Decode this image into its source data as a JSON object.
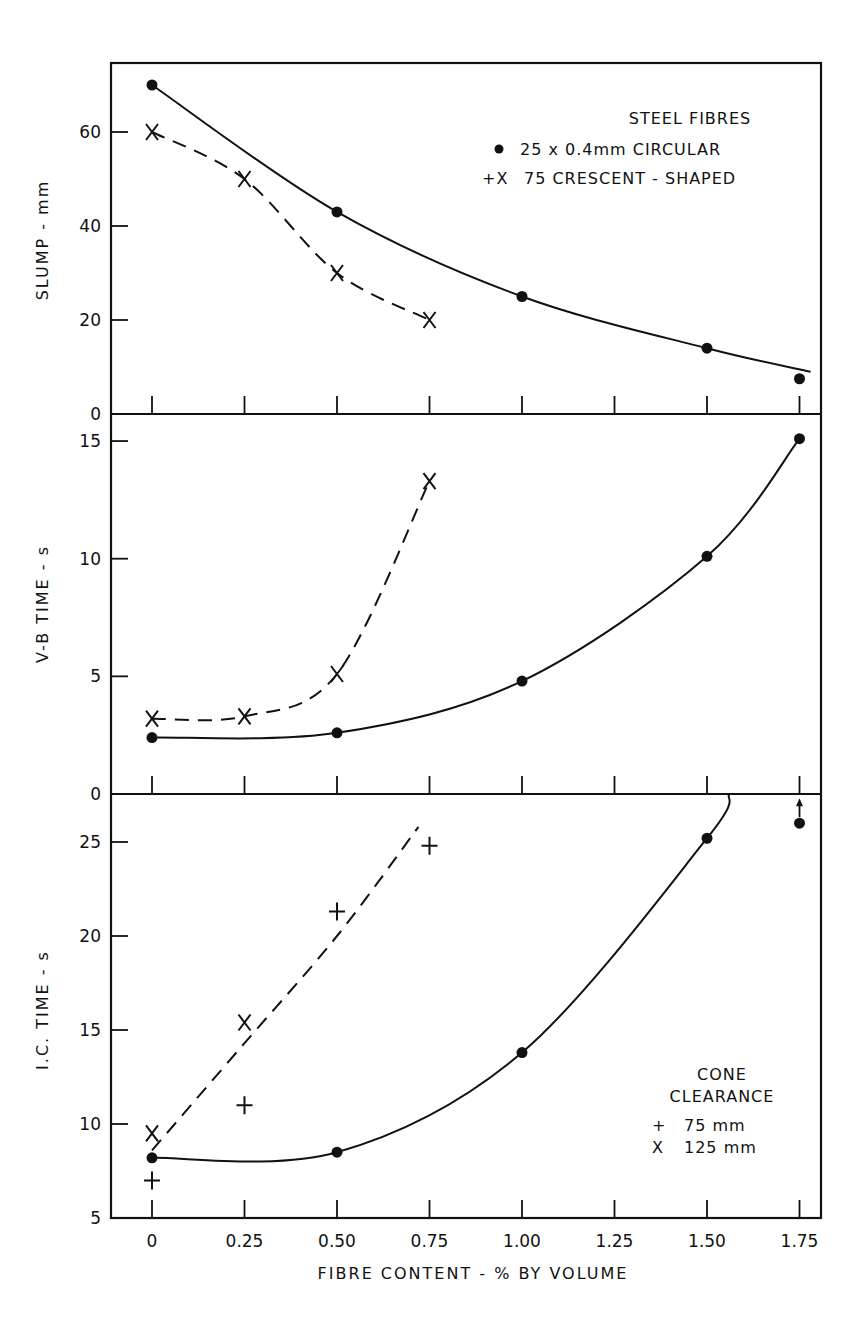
{
  "chart_data": [
    {
      "type": "line",
      "panel": "top",
      "title": "",
      "xlabel": "FIBRE CONTENT - % BY VOLUME",
      "ylabel": "SLUMP - mm",
      "ylim": [
        0,
        75
      ],
      "yticks": [
        0,
        20,
        40,
        60
      ],
      "xlim": [
        -0.1,
        1.8
      ],
      "xticks": [
        0,
        0.25,
        0.5,
        0.75,
        1.0,
        1.25,
        1.5,
        1.75
      ],
      "grid": false,
      "legend": {
        "title": "STEEL FIBRES",
        "entries": [
          {
            "marker": "dot",
            "label": "25 x 0.4mm CIRCULAR"
          },
          {
            "marker": "+X",
            "label": "75 CRESCENT - SHAPED"
          }
        ],
        "position": "upper right"
      },
      "series": [
        {
          "name": "25 x 0.4mm CIRCULAR",
          "marker": "dot",
          "line": "solid",
          "x": [
            0,
            0.5,
            1.0,
            1.5,
            1.75
          ],
          "y": [
            70,
            43,
            25,
            14,
            7.5
          ]
        },
        {
          "name": "75 CRESCENT-SHAPED",
          "marker": "x",
          "line": "dashed",
          "x": [
            0,
            0.25,
            0.5,
            0.75
          ],
          "y": [
            60,
            50,
            30,
            20
          ]
        }
      ]
    },
    {
      "type": "line",
      "panel": "middle",
      "xlabel": "FIBRE CONTENT - % BY VOLUME",
      "ylabel": "V-B TIME - s",
      "ylim": [
        0,
        16
      ],
      "yticks": [
        0,
        5,
        10,
        15
      ],
      "xticks": [
        0,
        0.25,
        0.5,
        0.75,
        1.0,
        1.25,
        1.5,
        1.75
      ],
      "grid": false,
      "series": [
        {
          "name": "25 x 0.4mm CIRCULAR",
          "marker": "dot",
          "line": "solid",
          "x": [
            0,
            0.5,
            1.0,
            1.5,
            1.75
          ],
          "y": [
            2.4,
            2.6,
            4.8,
            10.1,
            15.1
          ]
        },
        {
          "name": "75 CRESCENT-SHAPED",
          "marker": "x",
          "line": "dashed",
          "x": [
            0,
            0.25,
            0.5,
            0.75
          ],
          "y": [
            3.2,
            3.3,
            5.1,
            13.3
          ]
        }
      ]
    },
    {
      "type": "line",
      "panel": "bottom",
      "xlabel": "FIBRE CONTENT - % BY VOLUME",
      "ylabel": "I.C. TIME - s",
      "ylim": [
        5,
        27.5
      ],
      "yticks": [
        5,
        10,
        15,
        20,
        25
      ],
      "xticks": [
        0,
        0.25,
        0.5,
        0.75,
        1.0,
        1.25,
        1.5,
        1.75
      ],
      "grid": false,
      "legend": {
        "title": "CONE CLEARANCE",
        "entries": [
          {
            "marker": "+",
            "label": "75 mm"
          },
          {
            "marker": "x",
            "label": "125 mm"
          }
        ],
        "position": "lower right"
      },
      "series": [
        {
          "name": "25 x 0.4mm CIRCULAR",
          "marker": "dot",
          "line": "solid",
          "x": [
            0,
            0.5,
            1.0,
            1.5,
            1.75
          ],
          "y": [
            8.2,
            8.5,
            13.8,
            25.2,
            26.0
          ],
          "annotations": [
            {
              "x": 1.75,
              "note": "arrow up (value exceeds)"
            }
          ]
        },
        {
          "name": "75 CRESCENT-SHAPED, 75 mm clearance",
          "marker": "+",
          "line": "none",
          "x": [
            0,
            0.25,
            0.5,
            0.75
          ],
          "y": [
            7.0,
            11.0,
            21.3,
            24.8
          ]
        },
        {
          "name": "75 CRESCENT-SHAPED, 125 mm clearance",
          "marker": "x",
          "line": "none",
          "x": [
            0,
            0.25
          ],
          "y": [
            9.5,
            15.4
          ]
        },
        {
          "name": "75 CRESCENT-SHAPED fit",
          "marker": "none",
          "line": "dashed",
          "x": [
            0,
            0.25,
            0.5,
            0.72
          ],
          "y": [
            8.6,
            14.3,
            20.0,
            25.8
          ]
        }
      ]
    }
  ],
  "labels": {
    "xlabel": "FIBRE CONTENT - % BY VOLUME",
    "x_ticks": [
      "0",
      "0.25",
      "0.50",
      "0.75",
      "1.00",
      "1.25",
      "1.50",
      "1.75"
    ],
    "top_ylabel": "SLUMP - mm",
    "top_yticks": [
      "0",
      "20",
      "40",
      "60"
    ],
    "mid_ylabel": "V-B TIME - s",
    "mid_yticks": [
      "0",
      "5",
      "10",
      "15"
    ],
    "bot_ylabel": "I.C. TIME - s",
    "bot_yticks": [
      "5",
      "10",
      "15",
      "20",
      "25"
    ],
    "legend_top_title": "STEEL FIBRES",
    "legend_top_line1": "25 x 0.4mm CIRCULAR",
    "legend_top_line2_marker": "+X",
    "legend_top_line2": "75 CRESCENT - SHAPED",
    "legend_bot_title1": "CONE",
    "legend_bot_title2": "CLEARANCE",
    "legend_bot_line1_marker": "+",
    "legend_bot_line1": "75 mm",
    "legend_bot_line2_marker": "X",
    "legend_bot_line2": "125 mm"
  }
}
